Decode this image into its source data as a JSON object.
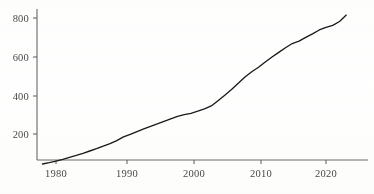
{
  "chart_data": {
    "type": "line",
    "title": "",
    "xlabel": "",
    "ylabel": "",
    "xlim": [
      1977.5,
      2023.5
    ],
    "ylim": [
      0,
      860
    ],
    "grid": false,
    "legend": null,
    "xticks": [
      1980,
      1990,
      2000,
      2010,
      2020
    ],
    "xtick_labels": [
      "1980",
      "1990",
      "2000",
      "2010",
      "2020"
    ],
    "yticks": [
      200,
      400,
      600,
      800
    ],
    "ytick_labels": [
      "200",
      "400",
      "600",
      "800"
    ],
    "series": [
      {
        "name": "series-1",
        "color": "#1a1a1a",
        "x": [
          1978,
          1979,
          1980,
          1981,
          1982,
          1983,
          1984,
          1985,
          1986,
          1987,
          1988,
          1989,
          1990,
          1991,
          1992,
          1993,
          1994,
          1995,
          1996,
          1997,
          1998,
          1999,
          2000,
          2001,
          2002,
          2003,
          2004,
          2005,
          2006,
          2007,
          2008,
          2009,
          2010,
          2011,
          2012,
          2013,
          2014,
          2015,
          2016,
          2017,
          2018,
          2019,
          2020,
          2021,
          2022,
          2023
        ],
        "values": [
          45,
          52,
          60,
          69,
          79,
          89,
          100,
          112,
          124,
          137,
          150,
          166,
          185,
          198,
          212,
          226,
          240,
          252,
          265,
          278,
          291,
          300,
          307,
          318,
          330,
          345,
          372,
          400,
          430,
          462,
          495,
          522,
          545,
          572,
          598,
          622,
          646,
          668,
          680,
          700,
          718,
          738,
          752,
          762,
          782,
          815
        ]
      }
    ]
  },
  "axes": {
    "axis_color": "#555555",
    "tick_color": "#555555",
    "label_color": "#4a4a4a",
    "background": "#ffffff"
  }
}
